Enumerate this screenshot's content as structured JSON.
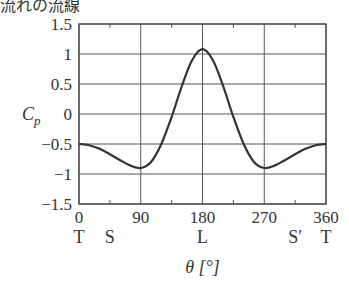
{
  "caption": "流れの流線",
  "chart_data": {
    "type": "line",
    "title": "",
    "xlabel": "θ [°]",
    "ylabel": "C_p",
    "xlim": [
      0,
      360
    ],
    "ylim": [
      -1.5,
      1.5
    ],
    "grid": true,
    "x_ticks": [
      0,
      90,
      180,
      270,
      360
    ],
    "x_tick_labels": [
      "0",
      "90",
      "180",
      "270",
      "360"
    ],
    "x_minor_ticks": [
      45,
      135,
      225,
      315
    ],
    "x_point_labels": [
      {
        "x": 0,
        "label": "T"
      },
      {
        "x": 45,
        "label": "S"
      },
      {
        "x": 180,
        "label": "L"
      },
      {
        "x": 315,
        "label": "S′"
      },
      {
        "x": 360,
        "label": "T"
      }
    ],
    "y_ticks": [
      1.5,
      1,
      0.5,
      0,
      -0.5,
      -1,
      -1.5
    ],
    "y_tick_labels": [
      "1.5",
      "1",
      "0.5",
      "0",
      "−0.5",
      "−1",
      "−1.5"
    ],
    "series": [
      {
        "name": "C_p",
        "color": "#333333",
        "x": [
          0,
          15,
          30,
          45,
          60,
          75,
          90,
          105,
          120,
          135,
          150,
          165,
          180,
          195,
          210,
          225,
          240,
          255,
          270,
          285,
          300,
          315,
          330,
          345,
          360
        ],
        "values": [
          -0.5,
          -0.52,
          -0.58,
          -0.67,
          -0.77,
          -0.86,
          -0.9,
          -0.8,
          -0.5,
          -0.05,
          0.47,
          0.9,
          1.08,
          0.9,
          0.47,
          -0.05,
          -0.5,
          -0.8,
          -0.9,
          -0.86,
          -0.77,
          -0.67,
          -0.58,
          -0.52,
          -0.5
        ]
      }
    ]
  }
}
